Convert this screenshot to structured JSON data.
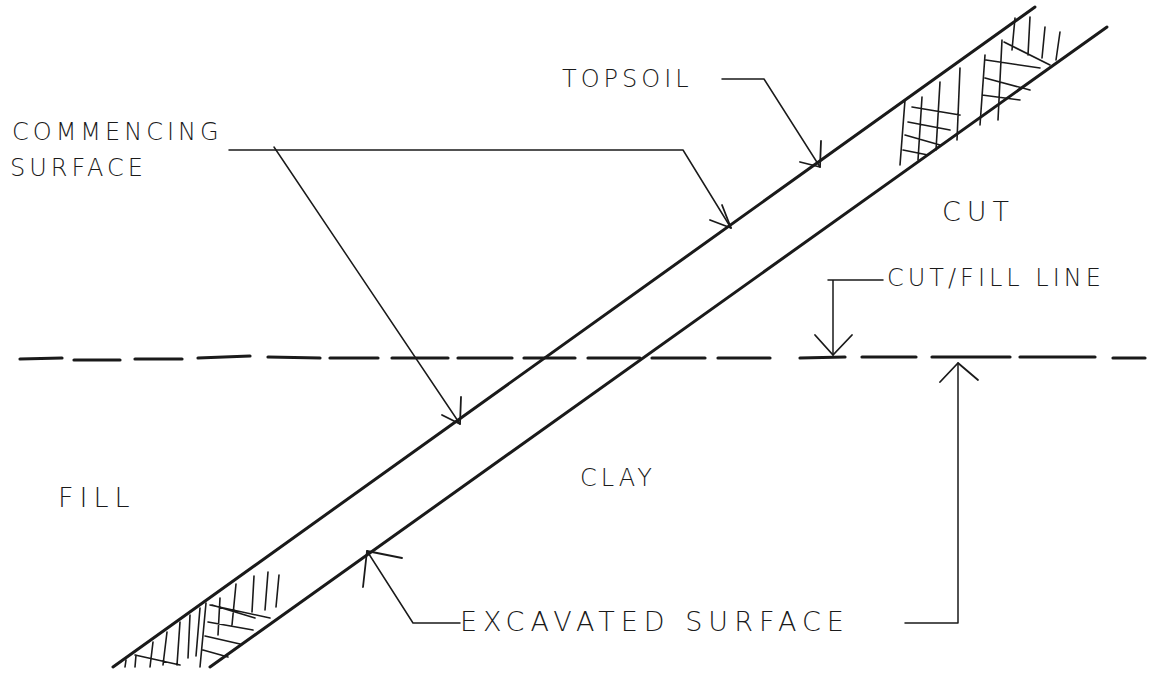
{
  "diagram": {
    "title": "",
    "labels": {
      "commencing_line1": "COMMENCING",
      "commencing_line2": "SURFACE",
      "topsoil": "TOPSOIL",
      "cut": "CUT",
      "cut_fill_line": "CUT/FILL LINE",
      "fill": "FILL",
      "clay": "CLAY",
      "excavated_surface": "EXCAVATED SURFACE"
    },
    "colors": {
      "ink": "#1a1a1a",
      "background": "#ffffff"
    },
    "elements": [
      {
        "id": "commencing-surface-line",
        "type": "line",
        "from": [
          113,
          667
        ],
        "to": [
          1035,
          7
        ]
      },
      {
        "id": "excavated-surface-line",
        "type": "line",
        "from": [
          210,
          667
        ],
        "to": [
          1107,
          27
        ]
      },
      {
        "id": "cut-fill-dashed-line",
        "type": "dashed-line",
        "y": 357,
        "x_range": [
          20,
          1145
        ]
      },
      {
        "id": "topsoil-hatch-upper",
        "type": "hatch",
        "region": "top-right band"
      },
      {
        "id": "topsoil-hatch-lower",
        "type": "hatch",
        "region": "bottom-left band"
      }
    ],
    "edges": [
      {
        "from": "commencing-surface-label",
        "to": "commencing-surface-line",
        "points": 2
      },
      {
        "from": "topsoil-label",
        "to": "topsoil-band"
      },
      {
        "from": "cut-fill-line-label",
        "to": "cut-fill-dashed-line"
      },
      {
        "from": "excavated-surface-label",
        "to": "excavated-surface-line"
      },
      {
        "from": "excavated-surface-label",
        "to": "cut-fill-dashed-line"
      }
    ]
  }
}
